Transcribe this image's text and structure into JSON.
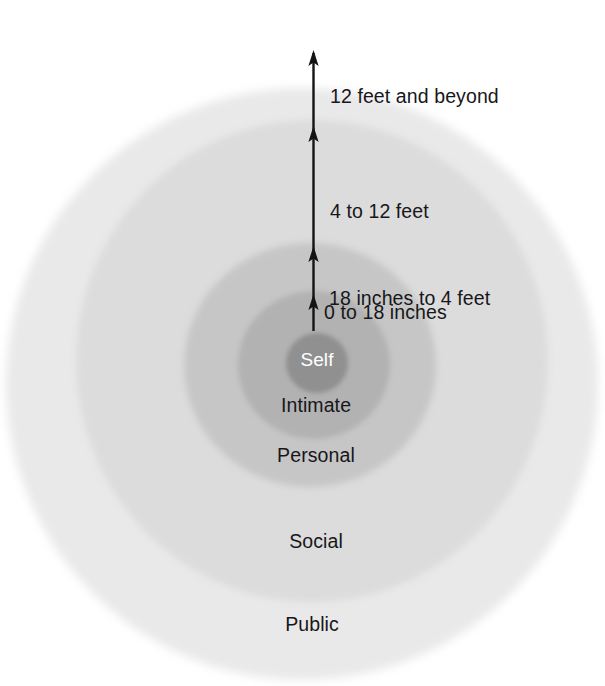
{
  "diagram": {
    "type": "concentric-circles",
    "center_label": "Self",
    "arrow": {
      "name": "distance-arrow",
      "orientation": "vertical",
      "arrowhead_count": 4,
      "direction": "up"
    },
    "zones": [
      {
        "id": "self",
        "label": "Self",
        "distance": "",
        "color": "#909090",
        "text_color": "#ffffff",
        "order": 0
      },
      {
        "id": "intimate",
        "label": "Intimate",
        "distance": "0 to 18 inches",
        "color": "#b2b2b2",
        "text_color": "#17171a",
        "order": 1
      },
      {
        "id": "personal",
        "label": "Personal",
        "distance": "18 inches to 4 feet",
        "color": "#c6c6c6",
        "text_color": "#17171a",
        "order": 2
      },
      {
        "id": "social",
        "label": "Social",
        "distance": "4 to 12 feet",
        "color": "#dcdcdc",
        "text_color": "#17171a",
        "order": 3
      },
      {
        "id": "public",
        "label": "Public",
        "distance": "12 feet and beyond",
        "color": "#e9e9e9",
        "text_color": "#17171a",
        "order": 4
      }
    ],
    "distance_labels": [
      "12 feet and beyond",
      "4 to 12 feet",
      "18 inches to 4 feet",
      "0 to 18 inches"
    ],
    "zone_labels": [
      "Self",
      "Intimate",
      "Personal",
      "Social",
      "Public"
    ],
    "background_color": "#ffffff",
    "arrow_color": "#141414"
  }
}
